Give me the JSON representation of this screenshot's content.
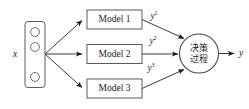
{
  "diagram": {
    "type": "ensemble-decision-flow",
    "input": {
      "label": "x",
      "unit_count": 3
    },
    "models": [
      {
        "label": "Model 1",
        "output_label": "y",
        "output_superscript": "1"
      },
      {
        "label": "Model 2",
        "output_label": "y",
        "output_superscript": "2"
      },
      {
        "label": "Model 3",
        "output_label": "y",
        "output_superscript": "3"
      }
    ],
    "decision": {
      "line1": "决策",
      "line2": "过程"
    },
    "output": {
      "label": "y"
    },
    "colors": {
      "background": "#ffffff",
      "box_stroke": "#5a5a5a",
      "edge_stroke": "#3a3a3a",
      "text": "#1a1a1a"
    }
  }
}
